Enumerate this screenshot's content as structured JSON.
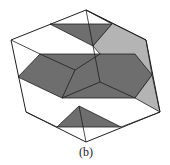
{
  "figure": {
    "caption": "(b)",
    "colors": {
      "dark": "#6e6e6e",
      "light": "#b4b4b4",
      "stroke": "#1e1e1e",
      "background": "#ffffff"
    },
    "outer_hexagon": [
      [
        86,
        10
      ],
      [
        146,
        40
      ],
      [
        160,
        112
      ],
      [
        86,
        142
      ],
      [
        26,
        112
      ],
      [
        11,
        40
      ]
    ],
    "shapes": [
      {
        "name": "top-dark-triangle",
        "fill": "dark",
        "points": [
          [
            50,
            24
          ],
          [
            112,
            24
          ],
          [
            93,
            46
          ]
        ]
      },
      {
        "name": "right-light-band",
        "fill": "light",
        "points": [
          [
            86,
            10
          ],
          [
            112,
            24
          ],
          [
            93,
            46
          ],
          [
            100,
            54
          ],
          [
            152,
            75
          ],
          [
            146,
            40
          ]
        ]
      },
      {
        "name": "middle-dark-hexagon",
        "fill": "dark",
        "points": [
          [
            18,
            77
          ],
          [
            40,
            54
          ],
          [
            135,
            54
          ],
          [
            152,
            75
          ],
          [
            135,
            98
          ],
          [
            62,
            98
          ]
        ]
      },
      {
        "name": "lower-right-light-triangle",
        "fill": "light",
        "points": [
          [
            152,
            75
          ],
          [
            160,
            112
          ],
          [
            135,
            98
          ]
        ]
      },
      {
        "name": "bottom-dark-triangle",
        "fill": "dark",
        "points": [
          [
            79,
            106
          ],
          [
            57,
            127
          ],
          [
            121,
            127
          ]
        ]
      }
    ],
    "inner_lines": [
      [
        [
          11,
          40
        ],
        [
          40,
          54
        ]
      ],
      [
        [
          40,
          54
        ],
        [
          75,
          70
        ]
      ],
      [
        [
          75,
          70
        ],
        [
          100,
          54
        ]
      ],
      [
        [
          75,
          70
        ],
        [
          62,
          98
        ]
      ],
      [
        [
          86,
          10
        ],
        [
          93,
          46
        ]
      ],
      [
        [
          93,
          46
        ],
        [
          100,
          82
        ]
      ],
      [
        [
          100,
          82
        ],
        [
          62,
          98
        ]
      ],
      [
        [
          100,
          82
        ],
        [
          135,
          98
        ]
      ],
      [
        [
          26,
          112
        ],
        [
          57,
          127
        ]
      ],
      [
        [
          121,
          127
        ],
        [
          160,
          112
        ]
      ],
      [
        [
          79,
          106
        ],
        [
          86,
          142
        ]
      ]
    ]
  }
}
